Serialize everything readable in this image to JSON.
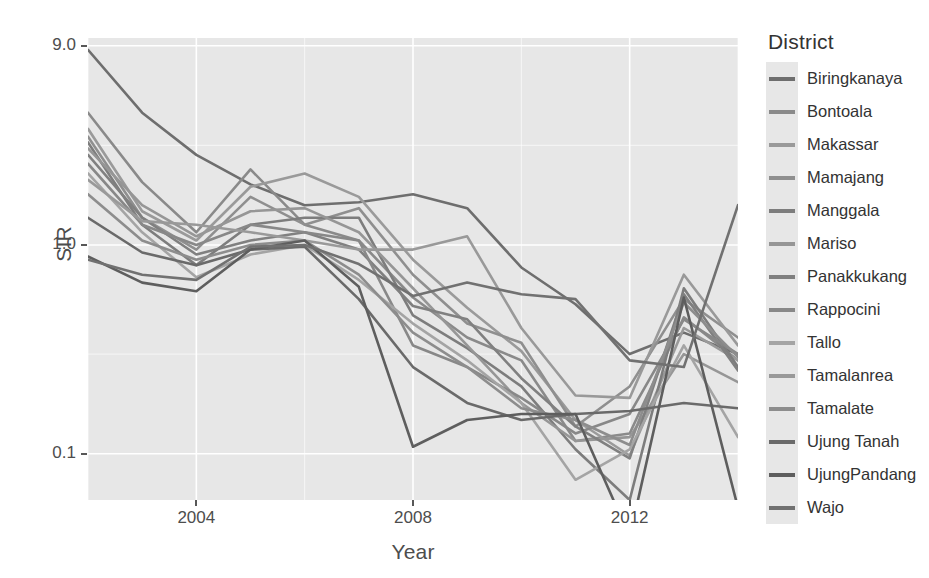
{
  "chart_data": {
    "type": "line",
    "title": "",
    "xlabel": "Year",
    "ylabel": "SIR",
    "y_scale": "log",
    "ylim": [
      0.06,
      9.8
    ],
    "xlim": [
      2002,
      2014
    ],
    "grid": true,
    "legend_position": "right",
    "legend_title": "District",
    "y_ticks": [
      "9.0",
      "1.0",
      "0.1"
    ],
    "y_tick_values": [
      9.0,
      1.0,
      0.1
    ],
    "x_ticks": [
      "2004",
      "2008",
      "2012"
    ],
    "x_tick_values": [
      2004,
      2008,
      2012
    ],
    "x": [
      2002,
      2003,
      2004,
      2005,
      2006,
      2007,
      2008,
      2009,
      2010,
      2011,
      2012,
      2013,
      2014
    ],
    "series": [
      {
        "name": "Biringkanaya",
        "color": "#6e6e6e",
        "values": [
          8.6,
          4.3,
          2.7,
          1.95,
          1.55,
          1.6,
          1.75,
          1.5,
          0.78,
          0.52,
          0.3,
          0.38,
          0.3
        ]
      },
      {
        "name": "Bontoala",
        "color": "#8a8a8a",
        "values": [
          4.3,
          2.0,
          1.15,
          2.3,
          1.25,
          1.05,
          0.56,
          0.36,
          0.28,
          0.115,
          0.125,
          0.45,
          0.28
        ]
      },
      {
        "name": "Makassar",
        "color": "#9a9a9a",
        "values": [
          3.6,
          1.45,
          1.05,
          1.9,
          2.2,
          1.7,
          0.85,
          0.5,
          0.31,
          0.145,
          0.098,
          0.4,
          0.28
        ]
      },
      {
        "name": "Mamajang",
        "color": "#8f8f8f",
        "values": [
          3.3,
          1.35,
          0.95,
          1.7,
          1.25,
          1.5,
          0.72,
          0.42,
          0.34,
          0.135,
          0.21,
          0.55,
          0.36
        ]
      },
      {
        "name": "Manggala",
        "color": "#7d7d7d",
        "values": [
          3.1,
          1.25,
          0.8,
          1.25,
          1.35,
          1.35,
          0.46,
          0.32,
          0.21,
          0.105,
          0.06,
          0.62,
          0.26
        ]
      },
      {
        "name": "Mariso",
        "color": "#969696",
        "values": [
          2.9,
          1.55,
          1.1,
          1.45,
          1.5,
          1.15,
          0.62,
          0.33,
          0.175,
          0.115,
          0.12,
          0.3,
          0.22
        ]
      },
      {
        "name": "Panakkukang",
        "color": "#808080",
        "values": [
          2.7,
          1.35,
          0.9,
          1.05,
          1.15,
          0.95,
          0.51,
          0.44,
          0.23,
          0.135,
          0.095,
          0.58,
          0.25
        ]
      },
      {
        "name": "Rappocini",
        "color": "#888888",
        "values": [
          2.45,
          1.25,
          1.0,
          1.25,
          1.15,
          1.05,
          0.33,
          0.26,
          0.185,
          0.125,
          0.155,
          0.44,
          0.3
        ]
      },
      {
        "name": "Tallo",
        "color": "#a4a4a4",
        "values": [
          2.2,
          1.15,
          0.7,
          0.9,
          1.0,
          0.68,
          0.42,
          0.28,
          0.175,
          0.075,
          0.105,
          0.33,
          0.12
        ]
      },
      {
        "name": "Tamalanrea",
        "color": "#999999",
        "values": [
          2.05,
          1.3,
          1.25,
          1.15,
          1.05,
          0.95,
          0.95,
          1.1,
          0.4,
          0.19,
          0.185,
          0.72,
          0.33
        ]
      },
      {
        "name": "Tamalate",
        "color": "#8d8d8d",
        "values": [
          1.75,
          1.05,
          0.85,
          1.0,
          1.05,
          0.72,
          0.38,
          0.26,
          0.165,
          0.145,
          0.11,
          0.53,
          0.29
        ]
      },
      {
        "name": "Ujung Tanah",
        "color": "#6a6a6a",
        "values": [
          1.35,
          0.92,
          0.8,
          0.95,
          0.98,
          0.55,
          0.26,
          0.175,
          0.145,
          0.155,
          0.16,
          0.175,
          0.165
        ]
      },
      {
        "name": "UjungPandang",
        "color": "#5e5e5e",
        "values": [
          0.88,
          0.66,
          0.6,
          0.95,
          1.05,
          0.63,
          0.108,
          0.145,
          0.155,
          0.155,
          0.04,
          0.56,
          0.055
        ]
      },
      {
        "name": "Wajo",
        "color": "#717171",
        "values": [
          0.85,
          0.72,
          0.68,
          0.98,
          1.0,
          0.81,
          0.57,
          0.66,
          0.58,
          0.55,
          0.28,
          0.26,
          1.55
        ]
      }
    ]
  },
  "axes": {
    "y_title": "SIR",
    "x_title": "Year",
    "y_tick_labels": [
      "9.0",
      "1.0",
      "0.1"
    ],
    "x_tick_labels": [
      "2004",
      "2008",
      "2012"
    ]
  },
  "legend": {
    "title": "District",
    "items": [
      {
        "label": "Biringkanaya",
        "color": "#6e6e6e"
      },
      {
        "label": "Bontoala",
        "color": "#8a8a8a"
      },
      {
        "label": "Makassar",
        "color": "#9a9a9a"
      },
      {
        "label": "Mamajang",
        "color": "#8f8f8f"
      },
      {
        "label": "Manggala",
        "color": "#7d7d7d"
      },
      {
        "label": "Mariso",
        "color": "#969696"
      },
      {
        "label": "Panakkukang",
        "color": "#808080"
      },
      {
        "label": "Rappocini",
        "color": "#888888"
      },
      {
        "label": "Tallo",
        "color": "#a4a4a4"
      },
      {
        "label": "Tamalanrea",
        "color": "#999999"
      },
      {
        "label": "Tamalate",
        "color": "#8d8d8d"
      },
      {
        "label": "Ujung Tanah",
        "color": "#6a6a6a"
      },
      {
        "label": "UjungPandang",
        "color": "#5e5e5e"
      },
      {
        "label": "Wajo",
        "color": "#717171"
      }
    ]
  },
  "theme": {
    "panel_background": "#e7e7e7",
    "gridline_color": "#ffffff",
    "page_background": "#ffffff",
    "text_color": "#4d4d4d"
  }
}
